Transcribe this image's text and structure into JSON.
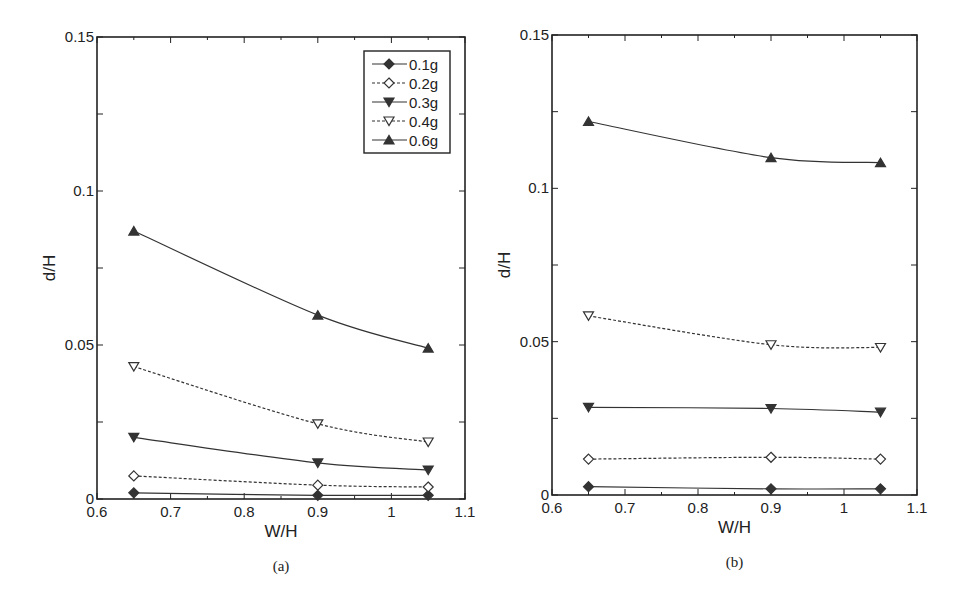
{
  "chart_data": [
    {
      "type": "line",
      "panel": "a",
      "caption": "(a)",
      "xlabel": "W/H",
      "ylabel": "d/H",
      "xlim": [
        0.6,
        1.1
      ],
      "ylim": [
        0,
        0.15
      ],
      "xticks": [
        0.6,
        0.7,
        0.8,
        0.9,
        1,
        1.1
      ],
      "xtick_labels": [
        "0.6",
        "0.7",
        "0.8",
        "0.9",
        "1",
        "1.1"
      ],
      "yticks": [
        0,
        0.05,
        0.1,
        0.15
      ],
      "ytick_labels": [
        "0",
        "0.05",
        "0.1",
        "0.15"
      ],
      "legend_position": "upper right",
      "grid": false,
      "x": [
        0.65,
        0.9,
        1.05
      ],
      "series": [
        {
          "name": "0.1g",
          "marker": "diamond-filled",
          "dashed": false,
          "values": [
            0.002,
            0.0012,
            0.0012
          ]
        },
        {
          "name": "0.2g",
          "marker": "diamond-open",
          "dashed": true,
          "values": [
            0.0075,
            0.0045,
            0.0039
          ]
        },
        {
          "name": "0.3g",
          "marker": "triangle-down-filled",
          "dashed": false,
          "values": [
            0.02,
            0.0117,
            0.0094
          ]
        },
        {
          "name": "0.4g",
          "marker": "triangle-down-open",
          "dashed": true,
          "values": [
            0.043,
            0.0244,
            0.0185
          ]
        },
        {
          "name": "0.6g",
          "marker": "triangle-up-filled",
          "dashed": false,
          "values": [
            0.087,
            0.0597,
            0.049
          ]
        }
      ]
    },
    {
      "type": "line",
      "panel": "b",
      "caption": "(b)",
      "xlabel": "W/H",
      "ylabel": "d/H",
      "xlim": [
        0.6,
        1.1
      ],
      "ylim": [
        0,
        0.15
      ],
      "xticks": [
        0.6,
        0.7,
        0.8,
        0.9,
        1,
        1.1
      ],
      "xtick_labels": [
        "0.6",
        "0.7",
        "0.8",
        "0.9",
        "1",
        "1.1"
      ],
      "yticks": [
        0,
        0.05,
        0.1,
        0.15
      ],
      "ytick_labels": [
        "0",
        "0.05",
        "0.1",
        "0.15"
      ],
      "legend_position": "none",
      "grid": false,
      "x": [
        0.65,
        0.9,
        1.05
      ],
      "series": [
        {
          "name": "0.1g",
          "marker": "diamond-filled",
          "dashed": false,
          "values": [
            0.0027,
            0.002,
            0.002
          ]
        },
        {
          "name": "0.2g",
          "marker": "diamond-open",
          "dashed": true,
          "values": [
            0.0117,
            0.0123,
            0.0117
          ]
        },
        {
          "name": "0.3g",
          "marker": "triangle-down-filled",
          "dashed": false,
          "values": [
            0.0286,
            0.0282,
            0.027
          ]
        },
        {
          "name": "0.4g",
          "marker": "triangle-down-open",
          "dashed": true,
          "values": [
            0.0584,
            0.049,
            0.0481
          ]
        },
        {
          "name": "0.6g",
          "marker": "triangle-up-filled",
          "dashed": false,
          "values": [
            0.1218,
            0.11,
            0.1084
          ]
        }
      ]
    }
  ],
  "panels": [
    {
      "id": "a",
      "left": 97,
      "right": 465,
      "top": 37,
      "bottom": 499,
      "show_legend": true
    },
    {
      "id": "b",
      "left": 552,
      "right": 917,
      "top": 35,
      "bottom": 495,
      "show_legend": false
    }
  ],
  "colors": {
    "line": "#333333",
    "axis": "#222222",
    "marker": "#333333",
    "background": "#ffffff"
  }
}
